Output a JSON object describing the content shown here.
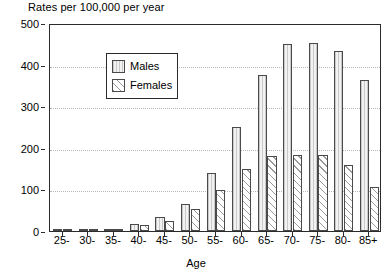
{
  "chart_data": {
    "type": "bar",
    "title": "Rates per 100,000 per year",
    "xlabel": "Age",
    "ylabel": "",
    "ylim": [
      0,
      500
    ],
    "ytick_step": 100,
    "yticks": [
      0,
      100,
      200,
      300,
      400,
      500
    ],
    "grid": "horizontal-dotted",
    "legend_position": "top-left-inside",
    "categories": [
      "25-",
      "30-",
      "35-",
      "40-",
      "45-",
      "50-",
      "55-",
      "60-",
      "65-",
      "70-",
      "75-",
      "80-",
      "85+"
    ],
    "series": [
      {
        "name": "Males",
        "pattern": "vertical-lines",
        "values": [
          2,
          3,
          5,
          18,
          33,
          65,
          140,
          250,
          375,
          450,
          452,
          432,
          362
        ]
      },
      {
        "name": "Females",
        "pattern": "diagonal-hatch",
        "values": [
          2,
          3,
          4,
          14,
          24,
          52,
          98,
          148,
          180,
          183,
          183,
          158,
          107
        ]
      }
    ]
  },
  "legend": {
    "items": [
      {
        "label": "Males",
        "swatch": "vertical-lines-swatch"
      },
      {
        "label": "Females",
        "swatch": "diagonal-hatch-swatch"
      }
    ]
  }
}
